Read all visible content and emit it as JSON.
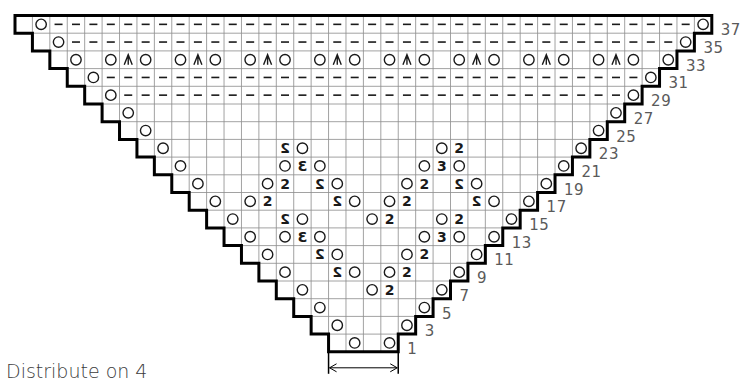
{
  "chart": {
    "type": "knitting-chart",
    "grid": {
      "origin_x": 15,
      "origin_y": 15.5,
      "cell_w": 17.42,
      "cell_h": 17.7,
      "total_cols": 40,
      "total_rows": 19,
      "line_color": "#8a8a8a",
      "border_color": "#000000",
      "symbol_color": "#1a1a1a"
    },
    "symbols_legend": {
      "yo": "yarn over (circle)",
      "dash": "purl (dash)",
      "cdd": "central double decrease (arrowhead)",
      "k2tog": "2",
      "ssk": "mirrored 2",
      "k3tog": "3",
      "sssk": "mirrored 3"
    },
    "rows": [
      {
        "label": "37",
        "cells": [
          {
            "c": 1,
            "s": "yo"
          },
          {
            "c": "2-38",
            "s": "dash"
          },
          {
            "c": 39,
            "s": "yo"
          }
        ]
      },
      {
        "label": "35",
        "cells": [
          {
            "c": 2,
            "s": "yo"
          },
          {
            "c": "3-37",
            "s": "dash"
          },
          {
            "c": 38,
            "s": "yo"
          }
        ]
      },
      {
        "label": "33",
        "cells": [
          {
            "c": 3,
            "s": "yo"
          },
          {
            "c": 5,
            "s": "yo"
          },
          {
            "c": 6,
            "s": "cdd"
          },
          {
            "c": 7,
            "s": "yo"
          },
          {
            "c": 9,
            "s": "yo"
          },
          {
            "c": 10,
            "s": "cdd"
          },
          {
            "c": 11,
            "s": "yo"
          },
          {
            "c": 13,
            "s": "yo"
          },
          {
            "c": 14,
            "s": "cdd"
          },
          {
            "c": 15,
            "s": "yo"
          },
          {
            "c": 17,
            "s": "yo"
          },
          {
            "c": 18,
            "s": "cdd"
          },
          {
            "c": 19,
            "s": "yo"
          },
          {
            "c": 21,
            "s": "yo"
          },
          {
            "c": 22,
            "s": "cdd"
          },
          {
            "c": 23,
            "s": "yo"
          },
          {
            "c": 25,
            "s": "yo"
          },
          {
            "c": 26,
            "s": "cdd"
          },
          {
            "c": 27,
            "s": "yo"
          },
          {
            "c": 29,
            "s": "yo"
          },
          {
            "c": 30,
            "s": "cdd"
          },
          {
            "c": 31,
            "s": "yo"
          },
          {
            "c": 33,
            "s": "yo"
          },
          {
            "c": 34,
            "s": "cdd"
          },
          {
            "c": 35,
            "s": "yo"
          },
          {
            "c": 37,
            "s": "yo"
          }
        ]
      },
      {
        "label": "31",
        "cells": [
          {
            "c": 4,
            "s": "yo"
          },
          {
            "c": "5-35",
            "s": "dash"
          },
          {
            "c": 36,
            "s": "yo"
          }
        ]
      },
      {
        "label": "29",
        "cells": [
          {
            "c": 5,
            "s": "yo"
          },
          {
            "c": "6-34",
            "s": "dash"
          },
          {
            "c": 35,
            "s": "yo"
          }
        ]
      },
      {
        "label": "27",
        "cells": [
          {
            "c": 6,
            "s": "yo"
          },
          {
            "c": 34,
            "s": "yo"
          }
        ]
      },
      {
        "label": "25",
        "cells": [
          {
            "c": 7,
            "s": "yo"
          },
          {
            "c": 33,
            "s": "yo"
          }
        ]
      },
      {
        "label": "23",
        "cells": [
          {
            "c": 8,
            "s": "yo"
          },
          {
            "c": 15,
            "s": "ssk"
          },
          {
            "c": 16,
            "s": "yo"
          },
          {
            "c": 24,
            "s": "yo"
          },
          {
            "c": 25,
            "s": "k2tog"
          },
          {
            "c": 32,
            "s": "yo"
          }
        ]
      },
      {
        "label": "21",
        "cells": [
          {
            "c": 9,
            "s": "yo"
          },
          {
            "c": 15,
            "s": "yo"
          },
          {
            "c": 16,
            "s": "sssk"
          },
          {
            "c": 17,
            "s": "yo"
          },
          {
            "c": 23,
            "s": "yo"
          },
          {
            "c": 24,
            "s": "k3tog"
          },
          {
            "c": 25,
            "s": "yo"
          },
          {
            "c": 31,
            "s": "yo"
          }
        ]
      },
      {
        "label": "19",
        "cells": [
          {
            "c": 10,
            "s": "yo"
          },
          {
            "c": 14,
            "s": "yo"
          },
          {
            "c": 15,
            "s": "k2tog"
          },
          {
            "c": 17,
            "s": "ssk"
          },
          {
            "c": 18,
            "s": "yo"
          },
          {
            "c": 22,
            "s": "yo"
          },
          {
            "c": 23,
            "s": "k2tog"
          },
          {
            "c": 25,
            "s": "ssk"
          },
          {
            "c": 26,
            "s": "yo"
          },
          {
            "c": 30,
            "s": "yo"
          }
        ]
      },
      {
        "label": "17",
        "cells": [
          {
            "c": 11,
            "s": "yo"
          },
          {
            "c": 13,
            "s": "yo"
          },
          {
            "c": 14,
            "s": "k2tog"
          },
          {
            "c": 18,
            "s": "ssk"
          },
          {
            "c": 19,
            "s": "yo"
          },
          {
            "c": 21,
            "s": "yo"
          },
          {
            "c": 22,
            "s": "k2tog"
          },
          {
            "c": 26,
            "s": "ssk"
          },
          {
            "c": 27,
            "s": "yo"
          },
          {
            "c": 29,
            "s": "yo"
          }
        ]
      },
      {
        "label": "15",
        "cells": [
          {
            "c": 12,
            "s": "yo"
          },
          {
            "c": 15,
            "s": "ssk"
          },
          {
            "c": 16,
            "s": "yo"
          },
          {
            "c": 20,
            "s": "yo"
          },
          {
            "c": 21,
            "s": "k2tog"
          },
          {
            "c": 24,
            "s": "yo"
          },
          {
            "c": 25,
            "s": "k2tog"
          },
          {
            "c": 28,
            "s": "yo"
          }
        ]
      },
      {
        "label": "13",
        "cells": [
          {
            "c": 13,
            "s": "yo"
          },
          {
            "c": 15,
            "s": "yo"
          },
          {
            "c": 16,
            "s": "sssk"
          },
          {
            "c": 17,
            "s": "yo"
          },
          {
            "c": 23,
            "s": "yo"
          },
          {
            "c": 24,
            "s": "k3tog"
          },
          {
            "c": 25,
            "s": "yo"
          },
          {
            "c": 27,
            "s": "yo"
          }
        ]
      },
      {
        "label": "11",
        "cells": [
          {
            "c": 14,
            "s": "yo"
          },
          {
            "c": 17,
            "s": "ssk"
          },
          {
            "c": 18,
            "s": "yo"
          },
          {
            "c": 22,
            "s": "yo"
          },
          {
            "c": 23,
            "s": "k2tog"
          },
          {
            "c": 26,
            "s": "yo"
          }
        ]
      },
      {
        "label": "9",
        "cells": [
          {
            "c": 15,
            "s": "yo"
          },
          {
            "c": 18,
            "s": "ssk"
          },
          {
            "c": 19,
            "s": "yo"
          },
          {
            "c": 21,
            "s": "yo"
          },
          {
            "c": 22,
            "s": "k2tog"
          },
          {
            "c": 25,
            "s": "yo"
          }
        ]
      },
      {
        "label": "7",
        "cells": [
          {
            "c": 16,
            "s": "yo"
          },
          {
            "c": 20,
            "s": "yo"
          },
          {
            "c": 21,
            "s": "k2tog"
          },
          {
            "c": 24,
            "s": "yo"
          }
        ]
      },
      {
        "label": "5",
        "cells": [
          {
            "c": 17,
            "s": "yo"
          },
          {
            "c": 23,
            "s": "yo"
          }
        ]
      },
      {
        "label": "3",
        "cells": [
          {
            "c": 18,
            "s": "yo"
          },
          {
            "c": 22,
            "s": "yo"
          }
        ]
      },
      {
        "label": "1",
        "cells": [
          {
            "c": 19,
            "s": "yo"
          },
          {
            "c": 21,
            "s": "yo"
          }
        ]
      }
    ],
    "repeat_arrow": {
      "from_col": 18,
      "to_col": 22
    }
  },
  "caption": "Distribute on 4"
}
